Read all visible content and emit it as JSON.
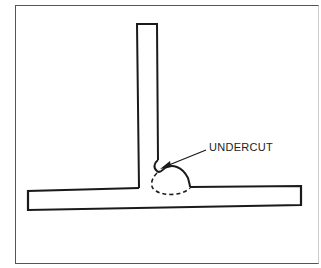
{
  "figure": {
    "annotation": {
      "label": "UNDERCUT"
    },
    "components": [
      "vertical-plate",
      "horizontal-plate",
      "weld-bead",
      "weld-penetration-dashed",
      "undercut-arrow"
    ]
  },
  "colors": {
    "line": "#1a1a1a",
    "background": "#ffffff",
    "frame": "#555555"
  }
}
